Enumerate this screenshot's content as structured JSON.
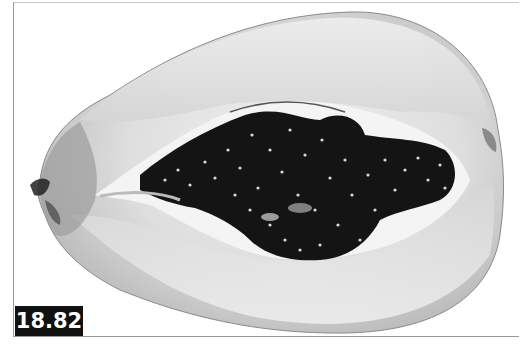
{
  "figure": {
    "label": "18.82",
    "colors": {
      "label_bg": "#111111",
      "label_text": "#ffffff",
      "flesh_light": "#e9e9e9",
      "flesh_mid": "#c9c9c9",
      "seeds": "#121212",
      "frame": "#9a9a9a"
    }
  }
}
